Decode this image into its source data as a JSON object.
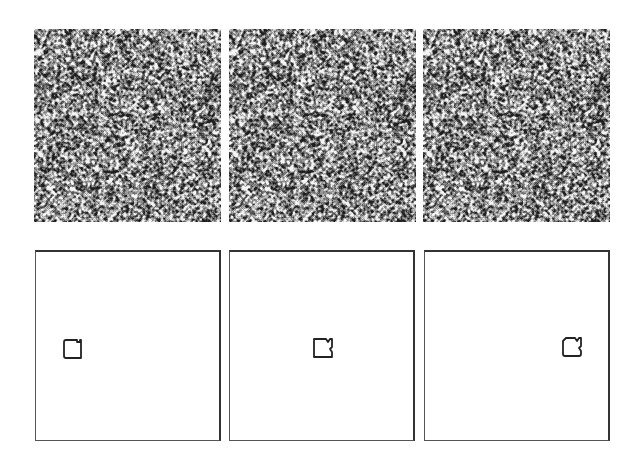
{
  "figure": {
    "noise_panels": [
      {
        "id": "noise-1",
        "label": "noise-stimulus-1"
      },
      {
        "id": "noise-2",
        "label": "noise-stimulus-2"
      },
      {
        "id": "noise-3",
        "label": "noise-stimulus-3"
      }
    ],
    "outline_panels": [
      {
        "id": "outline-1",
        "target_position": "left"
      },
      {
        "id": "outline-2",
        "target_position": "center"
      },
      {
        "id": "outline-3",
        "target_position": "right"
      }
    ],
    "colors": {
      "background": "#ffffff",
      "frame": "#333333",
      "target_outline": "#222222"
    }
  }
}
